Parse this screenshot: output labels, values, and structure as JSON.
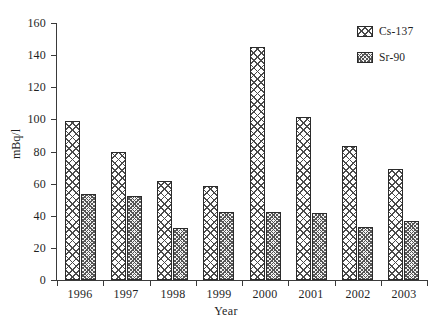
{
  "chart_data": {
    "type": "bar",
    "title": "",
    "xlabel": "Year",
    "ylabel": "mBq/l",
    "categories": [
      "1996",
      "1997",
      "1998",
      "1999",
      "2000",
      "2001",
      "2002",
      "2003"
    ],
    "series": [
      {
        "name": "Cs-137",
        "values": [
          99,
          80,
          61.5,
          58.5,
          145,
          101.5,
          83.5,
          69
        ]
      },
      {
        "name": "Sr-90",
        "values": [
          53.5,
          52.5,
          32.5,
          42.5,
          42.5,
          42,
          33,
          37
        ]
      }
    ],
    "ylim": [
      0,
      160
    ],
    "yticks": [
      0,
      20,
      40,
      60,
      80,
      100,
      120,
      140,
      160
    ],
    "ytick_labels": [
      "0",
      "20",
      "40",
      "60",
      "80",
      "100",
      "120",
      "140",
      "160"
    ],
    "grid": false,
    "legend_position": "top-right",
    "legend_entries": [
      "Cs-137",
      "Sr-90"
    ],
    "colors": {
      "cs137_fill": "#ffffff",
      "cs137_hatch": "#4a4a4a",
      "sr90_fill": "#f2f2f2",
      "sr90_hatch": "#555555",
      "axis": "#3a3a3a",
      "text": "#1f1f1f",
      "background": "#ffffff"
    }
  }
}
